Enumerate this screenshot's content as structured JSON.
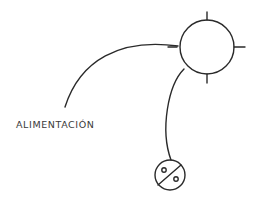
{
  "diagram": {
    "type": "electrical-schematic",
    "labels": {
      "feed": "ALIMENTACIÓN"
    },
    "elements": [
      {
        "id": "light-point",
        "shape": "circle-with-4-ticks",
        "meaning": "ceiling light point"
      },
      {
        "id": "switch",
        "shape": "circle-with-diagonal-and-two-dots",
        "meaning": "switch"
      },
      {
        "id": "feed-line",
        "meaning": "supply cable to light point"
      },
      {
        "id": "switch-line",
        "meaning": "cable from light point to switch"
      }
    ],
    "colors": {
      "line": "#2a2a2a",
      "background": "#ffffff",
      "text": "#3a3a3a"
    }
  }
}
